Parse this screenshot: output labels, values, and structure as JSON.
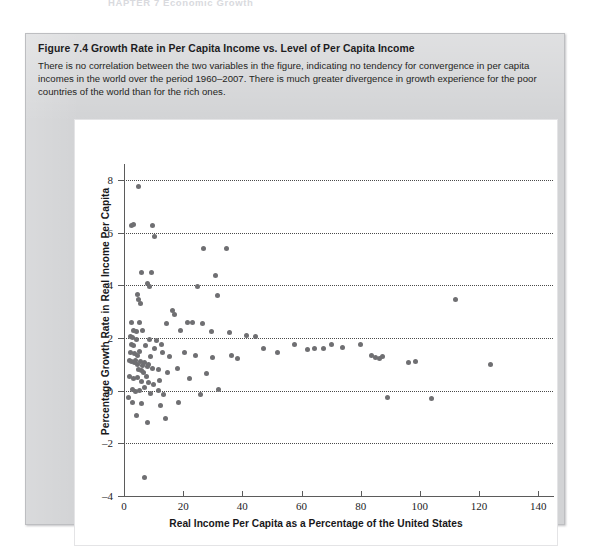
{
  "running_head": "HAPTER 7  Economic Growth",
  "figure": {
    "label": "Figure 7.4",
    "title": "Growth Rate in Per Capita Income vs. Level of Per Capita Income",
    "description": "There is no correlation between the two variables in the figure, indicating no tendency for convergence in per capita incomes in the world over the period 1960–2007. There is much greater divergence in growth experience for the poor countries of the world than for the rich ones."
  },
  "chart_data": {
    "type": "scatter",
    "title": "Growth Rate in Per Capita Income vs. Level of Per Capita Income",
    "xlabel": "Real Income Per Capita as a Percentage of the United States",
    "ylabel": "Percentage Growth Rate in Real Income Per Capita",
    "xlim": [
      0,
      145
    ],
    "ylim": [
      -4,
      8.6
    ],
    "xticks": [
      0,
      20,
      40,
      60,
      80,
      100,
      120,
      140
    ],
    "yticks": [
      -4,
      -2,
      0,
      2,
      4,
      6,
      8
    ],
    "gridlines_y": [
      -2,
      0,
      2,
      4,
      6,
      8
    ],
    "grid": "horizontal-dotted",
    "legend": "none",
    "marker_color": "#6f6f72",
    "n_points": 118,
    "points": [
      [
        5.0,
        7.75
      ],
      [
        2.6,
        6.25
      ],
      [
        3.2,
        6.3
      ],
      [
        9.5,
        6.25
      ],
      [
        10.4,
        5.85
      ],
      [
        27.0,
        5.4
      ],
      [
        34.5,
        5.4
      ],
      [
        6.0,
        4.5
      ],
      [
        9.2,
        4.5
      ],
      [
        31.0,
        4.35
      ],
      [
        7.8,
        4.05
      ],
      [
        8.6,
        3.95
      ],
      [
        25.0,
        3.95
      ],
      [
        112.0,
        3.45
      ],
      [
        4.6,
        3.65
      ],
      [
        4.9,
        3.45
      ],
      [
        5.6,
        3.3
      ],
      [
        31.5,
        3.6
      ],
      [
        16.5,
        3.05
      ],
      [
        17.0,
        2.9
      ],
      [
        2.4,
        2.6
      ],
      [
        5.4,
        2.6
      ],
      [
        14.2,
        2.55
      ],
      [
        21.5,
        2.6
      ],
      [
        23.0,
        2.6
      ],
      [
        26.5,
        2.55
      ],
      [
        3.2,
        2.3
      ],
      [
        4.1,
        2.25
      ],
      [
        6.2,
        2.3
      ],
      [
        19.2,
        2.3
      ],
      [
        29.5,
        2.25
      ],
      [
        35.5,
        2.2
      ],
      [
        2.3,
        2.05
      ],
      [
        3.0,
        2.0
      ],
      [
        4.3,
        1.95
      ],
      [
        8.6,
        1.95
      ],
      [
        11.0,
        1.9
      ],
      [
        41.5,
        2.1
      ],
      [
        44.5,
        2.05
      ],
      [
        2.5,
        1.75
      ],
      [
        3.3,
        1.7
      ],
      [
        7.3,
        1.7
      ],
      [
        10.2,
        1.6
      ],
      [
        12.6,
        1.75
      ],
      [
        47.0,
        1.6
      ],
      [
        52.0,
        1.45
      ],
      [
        57.5,
        1.75
      ],
      [
        62.0,
        1.55
      ],
      [
        64.5,
        1.6
      ],
      [
        67.5,
        1.6
      ],
      [
        70.0,
        1.75
      ],
      [
        74.0,
        1.65
      ],
      [
        80.0,
        1.75
      ],
      [
        2.2,
        1.45
      ],
      [
        3.6,
        1.4
      ],
      [
        4.4,
        1.35
      ],
      [
        5.2,
        1.5
      ],
      [
        9.0,
        1.3
      ],
      [
        13.0,
        1.45
      ],
      [
        15.5,
        1.3
      ],
      [
        20.5,
        1.45
      ],
      [
        24.0,
        1.35
      ],
      [
        30.0,
        1.25
      ],
      [
        36.5,
        1.35
      ],
      [
        38.5,
        1.2
      ],
      [
        83.5,
        1.35
      ],
      [
        85.0,
        1.25
      ],
      [
        86.5,
        1.2
      ],
      [
        87.5,
        1.3
      ],
      [
        1.9,
        1.15
      ],
      [
        2.7,
        1.1
      ],
      [
        3.4,
        1.05
      ],
      [
        4.0,
        1.15
      ],
      [
        4.7,
        1.0
      ],
      [
        5.5,
        1.1
      ],
      [
        6.4,
        0.95
      ],
      [
        7.0,
        1.05
      ],
      [
        7.9,
        0.9
      ],
      [
        8.4,
        1.0
      ],
      [
        5.0,
        0.8
      ],
      [
        5.8,
        0.75
      ],
      [
        6.6,
        0.7
      ],
      [
        9.8,
        0.85
      ],
      [
        11.5,
        0.8
      ],
      [
        14.8,
        0.7
      ],
      [
        18.0,
        0.85
      ],
      [
        28.0,
        0.65
      ],
      [
        96.0,
        1.05
      ],
      [
        98.5,
        1.1
      ],
      [
        124.0,
        1.0
      ],
      [
        2.0,
        0.55
      ],
      [
        3.1,
        0.45
      ],
      [
        4.5,
        0.5
      ],
      [
        6.0,
        0.35
      ],
      [
        7.5,
        0.55
      ],
      [
        8.2,
        0.3
      ],
      [
        10.0,
        0.25
      ],
      [
        12.0,
        0.4
      ],
      [
        22.0,
        0.45
      ],
      [
        1.5,
        -0.25
      ],
      [
        2.8,
        0.05
      ],
      [
        3.9,
        -0.05
      ],
      [
        5.1,
        0.0
      ],
      [
        6.8,
        0.1
      ],
      [
        8.9,
        -0.1
      ],
      [
        11.8,
        0.0
      ],
      [
        13.5,
        -0.15
      ],
      [
        32.0,
        0.05
      ],
      [
        3.0,
        -0.45
      ],
      [
        5.9,
        -0.5
      ],
      [
        12.5,
        -0.55
      ],
      [
        18.5,
        -0.45
      ],
      [
        26.0,
        -0.15
      ],
      [
        89.0,
        -0.25
      ],
      [
        104.0,
        -0.3
      ],
      [
        4.2,
        -0.95
      ],
      [
        8.0,
        -1.2
      ],
      [
        14.0,
        -1.05
      ],
      [
        7.0,
        -3.3
      ]
    ]
  },
  "axis_titles": {
    "x": "Real Income Per Capita as a Percentage of the United States",
    "y": "Percentage Growth Rate in Real Income Per Capita"
  }
}
